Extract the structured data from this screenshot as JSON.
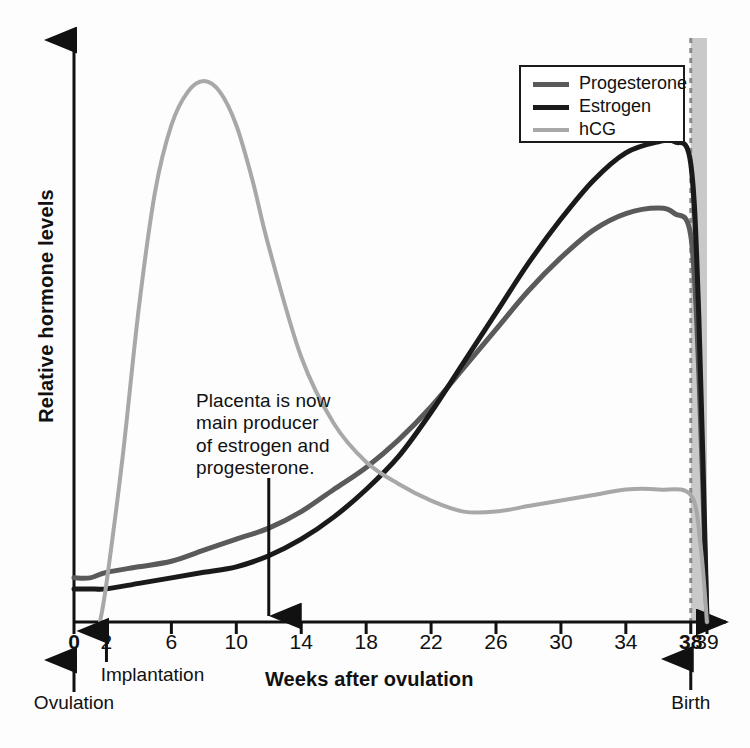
{
  "chart_data": {
    "type": "line",
    "title": "",
    "xlabel": "Weeks after ovulation",
    "ylabel": "Relative hormone levels",
    "xlim": [
      0,
      39
    ],
    "ylim": [
      0,
      100
    ],
    "grid": false,
    "legend_position": "top-right",
    "xticks": [
      {
        "value": 0,
        "label": "0",
        "bold": true
      },
      {
        "value": 2,
        "label": "2",
        "bold": false
      },
      {
        "value": 6,
        "label": "6",
        "bold": false
      },
      {
        "value": 10,
        "label": "10",
        "bold": false
      },
      {
        "value": 14,
        "label": "14",
        "bold": false
      },
      {
        "value": 18,
        "label": "18",
        "bold": false
      },
      {
        "value": 22,
        "label": "22",
        "bold": false
      },
      {
        "value": 26,
        "label": "26",
        "bold": false
      },
      {
        "value": 30,
        "label": "30",
        "bold": false
      },
      {
        "value": 34,
        "label": "34",
        "bold": false
      },
      {
        "value": 38,
        "label": "38",
        "bold": true
      },
      {
        "value": 39,
        "label": "39",
        "bold": false
      }
    ],
    "yticks": [],
    "series": [
      {
        "name": "Progesterone",
        "color": "#5a5a5a",
        "x": [
          0,
          1,
          2,
          4,
          6,
          8,
          10,
          12,
          14,
          16,
          18,
          20,
          22,
          24,
          26,
          28,
          30,
          32,
          34,
          36,
          37,
          38,
          38.5,
          39
        ],
        "values": [
          8,
          8,
          9,
          10,
          11,
          13,
          15,
          17,
          20,
          24,
          28,
          33,
          39,
          46,
          53,
          60,
          66,
          71,
          74,
          75,
          74,
          70,
          45,
          0
        ]
      },
      {
        "name": "Estrogen",
        "color": "#1a1a1a",
        "x": [
          0,
          1,
          2,
          4,
          6,
          8,
          10,
          12,
          14,
          16,
          18,
          20,
          22,
          24,
          26,
          28,
          30,
          32,
          34,
          36,
          37,
          38,
          38.5,
          39
        ],
        "values": [
          6,
          6,
          6,
          7,
          8,
          9,
          10,
          12,
          15,
          19,
          24,
          30,
          38,
          47,
          56,
          65,
          73,
          80,
          85,
          87,
          87,
          83,
          55,
          0
        ]
      },
      {
        "name": "hCG",
        "color": "#a8a8a8",
        "x": [
          1.6,
          2,
          3,
          4,
          5,
          6,
          7,
          8,
          9,
          10,
          11,
          12,
          14,
          16,
          18,
          20,
          22,
          24,
          26,
          28,
          30,
          32,
          34,
          36,
          38,
          38.6,
          39
        ],
        "values": [
          0,
          7,
          30,
          57,
          78,
          90,
          96,
          98,
          96,
          90,
          80,
          68,
          48,
          36,
          29,
          25,
          22,
          20,
          20,
          21,
          22,
          23,
          24,
          24,
          23,
          14,
          0
        ]
      }
    ],
    "annotations": [
      {
        "name": "placenta-note",
        "text": "Placenta is now\nmain producer\nof estrogen and\nprogesterone.",
        "arrow_x": 12
      }
    ],
    "events": [
      {
        "name": "ovulation",
        "label": "Ovulation",
        "value": 0
      },
      {
        "name": "implantation",
        "label": "Implantation",
        "value": 2
      },
      {
        "name": "birth",
        "label": "Birth",
        "value": 38
      }
    ],
    "birth_marker": {
      "value": 38,
      "style": "dashed",
      "shaded_region": [
        38,
        39
      ],
      "shade_color": "#c9c9c9"
    }
  },
  "legend": {
    "items": [
      {
        "label": "Progesterone",
        "color": "#5a5a5a",
        "width": 5
      },
      {
        "label": "Estrogen",
        "color": "#1a1a1a",
        "width": 5
      },
      {
        "label": "hCG",
        "color": "#a8a8a8",
        "width": 4
      }
    ]
  },
  "axes": {
    "x_title": "Weeks after ovulation",
    "y_title": "Relative hormone levels"
  }
}
